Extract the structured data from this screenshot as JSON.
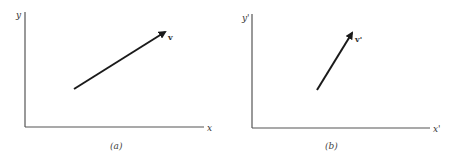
{
  "panels": [
    {
      "id": "a",
      "caption": "(a)",
      "x_label": "x",
      "y_label": "y",
      "vector_label": "v",
      "vector": {
        "from": [
          74,
          89
        ],
        "to": [
          167,
          31
        ]
      }
    },
    {
      "id": "b",
      "caption": "(b)",
      "x_label": "x'",
      "y_label": "y'",
      "vector_label": "v'",
      "vector": {
        "from": [
          317,
          90
        ],
        "to": [
          353,
          31
        ]
      }
    }
  ],
  "colors": {
    "axis": "#555555",
    "vector": "#1a1a1a",
    "background": "#ffffff"
  }
}
